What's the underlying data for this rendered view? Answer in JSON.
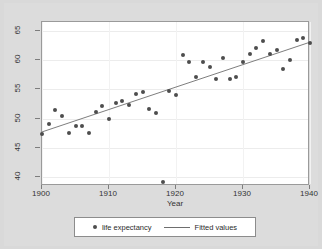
{
  "chart_data": {
    "type": "scatter",
    "title": "",
    "xlabel": "Year",
    "ylabel": "",
    "xlim": [
      1900,
      1940
    ],
    "ylim": [
      38.5,
      66.5
    ],
    "xticks": [
      1900,
      1910,
      1920,
      1930,
      1940
    ],
    "yticks": [
      40,
      45,
      50,
      55,
      60,
      65
    ],
    "grid": "horizontal",
    "legend_position": "below",
    "series": [
      {
        "name": "life expectancy",
        "type": "scatter",
        "marker": "circle",
        "color": "#4d4d4d",
        "x": [
          1900,
          1901,
          1902,
          1903,
          1904,
          1905,
          1906,
          1907,
          1908,
          1909,
          1910,
          1911,
          1912,
          1913,
          1914,
          1915,
          1916,
          1917,
          1918,
          1919,
          1920,
          1921,
          1922,
          1923,
          1924,
          1925,
          1926,
          1927,
          1928,
          1929,
          1930,
          1931,
          1932,
          1933,
          1934,
          1935,
          1936,
          1937,
          1938,
          1939,
          1940
        ],
        "y": [
          47.3,
          49.1,
          51.5,
          50.5,
          47.6,
          48.7,
          48.7,
          47.6,
          51.1,
          52.1,
          50.0,
          52.6,
          53.0,
          52.3,
          54.2,
          54.5,
          51.7,
          50.9,
          39.1,
          54.7,
          54.1,
          60.8,
          59.6,
          57.1,
          59.7,
          58.9,
          56.7,
          60.4,
          56.8,
          57.1,
          59.7,
          61.1,
          62.1,
          63.3,
          61.1,
          61.7,
          58.5,
          60.0,
          63.5,
          63.7,
          62.9
        ]
      },
      {
        "name": "Fitted values",
        "type": "line",
        "color": "#6e6e6e",
        "x": [
          1900,
          1940
        ],
        "y": [
          47.5,
          62.9
        ]
      }
    ]
  },
  "legend": {
    "items": [
      {
        "label": "life expectancy",
        "marker": "circle"
      },
      {
        "label": "Fitted values",
        "marker": "line"
      }
    ]
  }
}
